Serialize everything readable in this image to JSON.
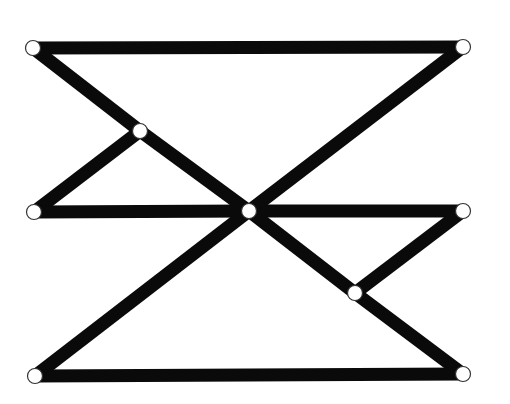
{
  "diagram": {
    "width": 510,
    "height": 404,
    "background": "#ffffff",
    "bar_color": "#0a0a0a",
    "bar_width": 13,
    "joint_fill": "#ffffff",
    "joint_stroke": "#333333",
    "joint_radius": 7.5,
    "nodes": [
      {
        "id": "top-left",
        "x": 33,
        "y": 48
      },
      {
        "id": "top-right",
        "x": 463,
        "y": 47
      },
      {
        "id": "upper-mid",
        "x": 140,
        "y": 131
      },
      {
        "id": "mid-left",
        "x": 34,
        "y": 212
      },
      {
        "id": "center",
        "x": 249,
        "y": 211
      },
      {
        "id": "mid-right",
        "x": 463,
        "y": 211
      },
      {
        "id": "lower-mid",
        "x": 355,
        "y": 293
      },
      {
        "id": "bottom-left",
        "x": 35,
        "y": 376
      },
      {
        "id": "bottom-right",
        "x": 463,
        "y": 374
      }
    ],
    "edges": [
      {
        "from": "top-left",
        "to": "top-right"
      },
      {
        "from": "top-left",
        "to": "upper-mid"
      },
      {
        "from": "upper-mid",
        "to": "center"
      },
      {
        "from": "top-right",
        "to": "center"
      },
      {
        "from": "center",
        "to": "bottom-left"
      },
      {
        "from": "upper-mid",
        "to": "mid-left"
      },
      {
        "from": "mid-left",
        "to": "center"
      },
      {
        "from": "center",
        "to": "mid-right"
      },
      {
        "from": "center",
        "to": "lower-mid"
      },
      {
        "from": "lower-mid",
        "to": "bottom-right"
      },
      {
        "from": "lower-mid",
        "to": "mid-right"
      },
      {
        "from": "bottom-left",
        "to": "bottom-right"
      }
    ]
  }
}
